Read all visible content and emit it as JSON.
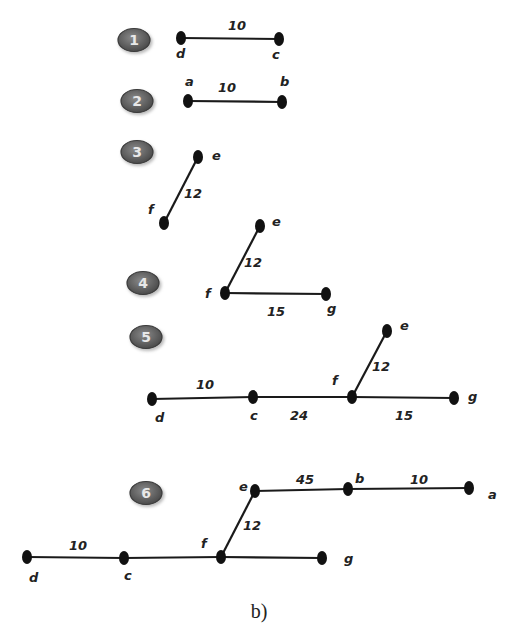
{
  "caption": "b)",
  "colors": {
    "badge_fill": "#6a6a6a",
    "badge_stroke": "#3a3a3a",
    "edge": "#1a1a1a",
    "node": "#111111"
  },
  "steps": [
    {
      "step": "1",
      "badge": {
        "x": 134,
        "y": 40
      },
      "nodes": [
        {
          "id": "d",
          "x": 181,
          "y": 38,
          "lx": 176,
          "ly": 58
        },
        {
          "id": "c",
          "x": 279,
          "y": 39,
          "lx": 272,
          "ly": 59
        }
      ],
      "edges": [
        {
          "from": "d",
          "to": "c",
          "weight": "10",
          "wx": 228,
          "wy": 30
        }
      ]
    },
    {
      "step": "2",
      "badge": {
        "x": 137,
        "y": 101
      },
      "nodes": [
        {
          "id": "a",
          "x": 188,
          "y": 101,
          "lx": 185,
          "ly": 86
        },
        {
          "id": "b",
          "x": 282,
          "y": 102,
          "lx": 280,
          "ly": 86
        }
      ],
      "edges": [
        {
          "from": "a",
          "to": "b",
          "weight": "10",
          "wx": 218,
          "wy": 92
        }
      ]
    },
    {
      "step": "3",
      "badge": {
        "x": 137,
        "y": 152
      },
      "nodes": [
        {
          "id": "e",
          "x": 198,
          "y": 157,
          "lx": 212,
          "ly": 160
        },
        {
          "id": "f",
          "x": 164,
          "y": 223,
          "lx": 148,
          "ly": 214
        }
      ],
      "edges": [
        {
          "from": "f",
          "to": "e",
          "weight": "12",
          "wx": 184,
          "wy": 198
        }
      ]
    },
    {
      "step": "4",
      "badge": {
        "x": 143,
        "y": 283
      },
      "nodes": [
        {
          "id": "e",
          "x": 260,
          "y": 226,
          "lx": 272,
          "ly": 226
        },
        {
          "id": "f",
          "x": 225,
          "y": 293,
          "lx": 205,
          "ly": 298
        },
        {
          "id": "g",
          "x": 326,
          "y": 294,
          "lx": 327,
          "ly": 313
        }
      ],
      "edges": [
        {
          "from": "f",
          "to": "e",
          "weight": "12",
          "wx": 244,
          "wy": 267
        },
        {
          "from": "f",
          "to": "g",
          "weight": "15",
          "wx": 267,
          "wy": 316
        }
      ]
    },
    {
      "step": "5",
      "badge": {
        "x": 146,
        "y": 337
      },
      "nodes": [
        {
          "id": "e",
          "x": 387,
          "y": 331,
          "lx": 400,
          "ly": 330
        },
        {
          "id": "f",
          "x": 352,
          "y": 397,
          "lx": 332,
          "ly": 385
        },
        {
          "id": "d",
          "x": 152,
          "y": 399,
          "lx": 155,
          "ly": 422
        },
        {
          "id": "c",
          "x": 253,
          "y": 397,
          "lx": 250,
          "ly": 420
        },
        {
          "id": "g",
          "x": 454,
          "y": 398,
          "lx": 468,
          "ly": 401
        }
      ],
      "edges": [
        {
          "from": "f",
          "to": "e",
          "weight": "12",
          "wx": 372,
          "wy": 371
        },
        {
          "from": "d",
          "to": "c",
          "weight": "10",
          "wx": 196,
          "wy": 389
        },
        {
          "from": "c",
          "to": "f",
          "weight": "24",
          "wx": 290,
          "wy": 420
        },
        {
          "from": "f",
          "to": "g",
          "weight": "15",
          "wx": 395,
          "wy": 420
        }
      ]
    },
    {
      "step": "6",
      "badge": {
        "x": 146,
        "y": 493
      },
      "nodes": [
        {
          "id": "e",
          "x": 255,
          "y": 491,
          "lx": 239,
          "ly": 491
        },
        {
          "id": "b",
          "x": 348,
          "y": 489,
          "lx": 355,
          "ly": 483
        },
        {
          "id": "a",
          "x": 469,
          "y": 488,
          "lx": 488,
          "ly": 499
        },
        {
          "id": "f",
          "x": 221,
          "y": 557,
          "lx": 201,
          "ly": 548
        },
        {
          "id": "d",
          "x": 27,
          "y": 557,
          "lx": 29,
          "ly": 582
        },
        {
          "id": "c",
          "x": 124,
          "y": 558,
          "lx": 124,
          "ly": 580
        },
        {
          "id": "g",
          "x": 322,
          "y": 558,
          "lx": 344,
          "ly": 563
        }
      ],
      "edges": [
        {
          "from": "e",
          "to": "b",
          "weight": "45",
          "wx": 296,
          "wy": 484
        },
        {
          "from": "b",
          "to": "a",
          "weight": "10",
          "wx": 410,
          "wy": 484
        },
        {
          "from": "f",
          "to": "e",
          "weight": "12",
          "wx": 243,
          "wy": 530
        },
        {
          "from": "d",
          "to": "c",
          "weight": "10",
          "wx": 69,
          "wy": 550
        },
        {
          "from": "c",
          "to": "f",
          "weight": "",
          "wx": 0,
          "wy": 0
        },
        {
          "from": "f",
          "to": "g",
          "weight": "",
          "wx": 0,
          "wy": 0
        }
      ]
    }
  ]
}
